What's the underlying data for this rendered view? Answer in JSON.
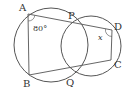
{
  "diagram": {
    "type": "geometry",
    "stroke_color": "#555555",
    "points": {
      "A": {
        "label": "A",
        "x": 28,
        "y": 14
      },
      "P": {
        "label": "P",
        "x": 71,
        "y": 24
      },
      "D": {
        "label": "D",
        "x": 112,
        "y": 30
      },
      "C": {
        "label": "C",
        "x": 111,
        "y": 60
      },
      "Q": {
        "label": "Q",
        "x": 71,
        "y": 68
      },
      "B": {
        "label": "B",
        "x": 29,
        "y": 75
      }
    },
    "circles": [
      {
        "name": "left-circle",
        "cx": 51,
        "cy": 45,
        "r": 37
      },
      {
        "name": "right-circle",
        "cx": 91,
        "cy": 46,
        "r": 30
      }
    ],
    "segments": [
      [
        "A",
        "D"
      ],
      [
        "A",
        "B"
      ],
      [
        "B",
        "C"
      ],
      [
        "D",
        "C"
      ],
      [
        "P",
        "Q"
      ]
    ],
    "angles": [
      {
        "vertex": "A",
        "label": "80°"
      },
      {
        "vertex": "D",
        "label": "x"
      }
    ]
  }
}
